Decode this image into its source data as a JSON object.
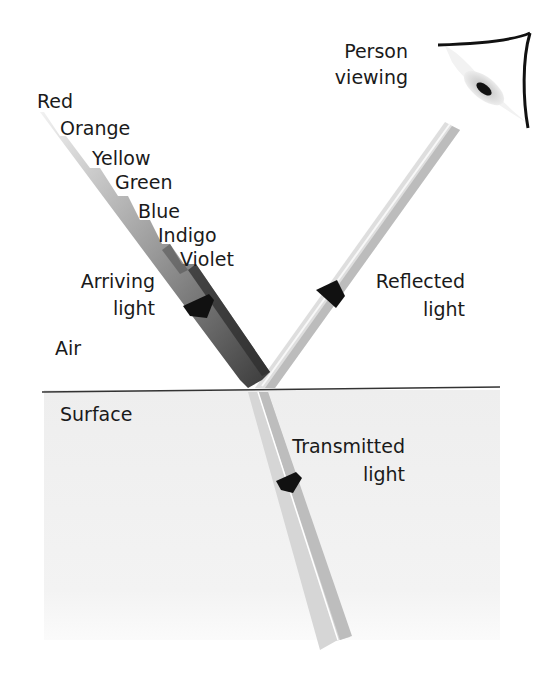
{
  "diagram": {
    "regions": {
      "air_label": "Air",
      "surface_label": "Surface"
    },
    "spectrum": {
      "colors": [
        "Red",
        "Orange",
        "Yellow",
        "Green",
        "Blue",
        "Indigo",
        "Violet"
      ]
    },
    "beams": {
      "arriving": {
        "line1": "Arriving",
        "line2": "light"
      },
      "reflected": {
        "line1": "Reflected",
        "line2": "light"
      },
      "transmitted": {
        "line1": "Transmitted",
        "line2": "light"
      }
    },
    "viewer": {
      "line1": "Person",
      "line2": "viewing"
    },
    "colors": {
      "text": "#1a1a1a",
      "surface_fill": "#f2f2f2",
      "surface_line": "#333333",
      "beam_dark": "#4a4a4a",
      "beam_light": "#d9d9d9",
      "arrow": "#111111"
    }
  }
}
